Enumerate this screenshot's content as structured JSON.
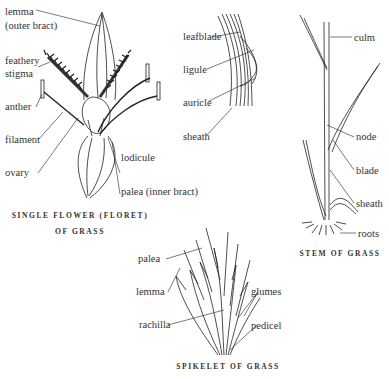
{
  "figures": {
    "floret": {
      "caption_line1": "Single flower (floret)",
      "caption_line2": "of grass",
      "labels": {
        "lemma": "lemma",
        "lemma_sub": "(outer bract)",
        "feathery": "feathery",
        "stigma": "stigma",
        "anther": "anther",
        "filament": "filament",
        "ovary": "ovary",
        "lodicule": "lodicule",
        "palea": "palea (inner bract)"
      }
    },
    "leaf_junction": {
      "labels": {
        "leafblade": "leafblade",
        "ligule": "ligule",
        "auricle": "auricle",
        "sheath": "sheath"
      }
    },
    "stem": {
      "caption": "Stem of grass",
      "labels": {
        "culm": "culm",
        "node": "node",
        "blade": "blade",
        "sheath": "sheath",
        "roots": "roots"
      }
    },
    "spikelet": {
      "caption": "Spikelet of grass",
      "labels": {
        "palea": "palea",
        "lemma": "lemma",
        "rachilla": "rachilla",
        "glumes": "glumes",
        "pedicel": "pedicel"
      }
    }
  }
}
